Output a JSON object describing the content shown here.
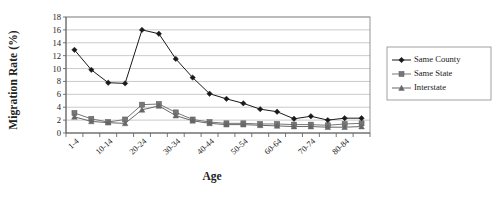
{
  "chart_data": {
    "type": "line",
    "title": "",
    "xlabel": "Age",
    "ylabel": "Migration Rate (%)",
    "ylim": [
      0,
      18
    ],
    "ytick_step": 2,
    "yticks": [
      "0",
      "2",
      "4",
      "6",
      "8",
      "10",
      "12",
      "14",
      "16",
      "18"
    ],
    "grid": true,
    "grid_axis": "y",
    "legend_position": "right",
    "categories": [
      "1-4",
      "5-9",
      "10-14",
      "15-19",
      "20-24",
      "25-29",
      "30-34",
      "35-39",
      "40-44",
      "45-49",
      "50-54",
      "55-59",
      "60-64",
      "65-69",
      "70-74",
      "75-79",
      "80-84",
      "85+"
    ],
    "xtick_labels_shown": [
      "1-4",
      "10-14",
      "20-24",
      "30-34",
      "40-44",
      "50-54",
      "60-64",
      "70-74",
      "80-84"
    ],
    "series": [
      {
        "name": "Same County",
        "marker": "diamond",
        "color": "#1a1a1a",
        "values": [
          12.9,
          9.8,
          7.8,
          7.7,
          16.0,
          15.4,
          11.5,
          8.6,
          6.1,
          5.3,
          4.6,
          3.7,
          3.3,
          2.2,
          2.6,
          2.0,
          2.3,
          2.3
        ]
      },
      {
        "name": "Same State",
        "marker": "square",
        "color": "#777777",
        "values": [
          3.1,
          2.2,
          1.7,
          2.1,
          4.4,
          4.5,
          3.2,
          2.1,
          1.7,
          1.5,
          1.5,
          1.4,
          1.4,
          1.3,
          1.3,
          1.2,
          1.4,
          1.5
        ]
      },
      {
        "name": "Interstate",
        "marker": "triangle",
        "color": "#666666",
        "values": [
          2.5,
          1.8,
          1.6,
          1.5,
          3.6,
          4.2,
          2.7,
          1.9,
          1.5,
          1.3,
          1.3,
          1.2,
          1.1,
          1.0,
          1.0,
          0.9,
          0.9,
          1.0
        ]
      }
    ]
  },
  "legend": {
    "items": [
      {
        "label": "Same County",
        "marker": "diamond"
      },
      {
        "label": "Same State",
        "marker": "square"
      },
      {
        "label": "Interstate",
        "marker": "triangle"
      }
    ]
  }
}
